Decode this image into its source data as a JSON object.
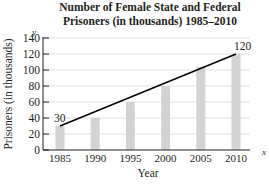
{
  "chart_data": {
    "type": "bar",
    "title": "Number of Female State and Federal Prisoners (in thousands) 1985–2010",
    "title_lines": [
      "Number of Female State and Federal",
      "Prisoners (in thousands) 1985–2010"
    ],
    "xlabel": "Year",
    "ylabel": "Prisoners (in thousands)",
    "x_axis_var": "x",
    "y_axis_var": "y",
    "categories": [
      "1985",
      "1990",
      "1995",
      "2000",
      "2005",
      "2010"
    ],
    "values": [
      30,
      40,
      60,
      80,
      104,
      120
    ],
    "yticks": [
      0,
      20,
      40,
      60,
      80,
      100,
      120,
      140
    ],
    "ylim": [
      0,
      140
    ],
    "grid": true,
    "bar_color": "#d3d3d3",
    "trend_line": {
      "from": {
        "x": "1985",
        "y": 30
      },
      "to": {
        "x": "2010",
        "y": 120
      },
      "color": "#000000"
    },
    "annotations": [
      {
        "text": "30",
        "x": "1985",
        "y": 30
      },
      {
        "text": "120",
        "x": "2010",
        "y": 120
      }
    ]
  }
}
